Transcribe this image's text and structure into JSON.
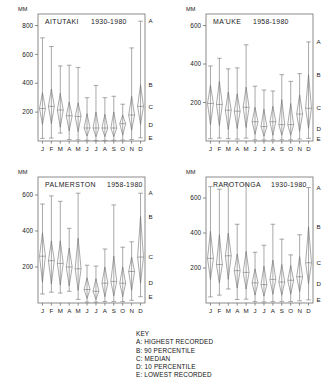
{
  "figure": {
    "axis_unit_label": "MM",
    "months": [
      "J",
      "F",
      "M",
      "A",
      "M",
      "J",
      "J",
      "A",
      "S",
      "O",
      "N",
      "D"
    ],
    "marker_labels": [
      "A",
      "B",
      "C",
      "D",
      "E"
    ]
  },
  "key": {
    "heading": "KEY",
    "items": [
      "A: HIGHEST RECORDED",
      "B: 90 PERCENTILE",
      "C: MEDIAN",
      "D: 10 PERCENTILE",
      "E: LOWEST RECORDED"
    ]
  },
  "chart_data": [
    {
      "type": "box",
      "title": "AITUTAKI",
      "subtitle": "1930-1980",
      "xlabel": "",
      "ylabel": "MM",
      "ylim": [
        0,
        880
      ],
      "yticks": [
        200,
        400,
        600,
        800
      ],
      "grid": false,
      "categories": [
        "J",
        "F",
        "M",
        "A",
        "M",
        "J",
        "J",
        "A",
        "S",
        "O",
        "N",
        "D"
      ],
      "series": [
        {
          "name": "highest",
          "values": [
            715,
            655,
            520,
            525,
            510,
            300,
            385,
            300,
            310,
            255,
            645,
            830
          ]
        },
        {
          "name": "p90",
          "values": [
            335,
            360,
            330,
            270,
            265,
            190,
            200,
            185,
            200,
            180,
            310,
            390
          ]
        },
        {
          "name": "median",
          "values": [
            225,
            240,
            215,
            175,
            170,
            90,
            90,
            90,
            90,
            120,
            180,
            240
          ]
        },
        {
          "name": "p10",
          "values": [
            115,
            120,
            95,
            70,
            65,
            35,
            30,
            30,
            30,
            40,
            75,
            115
          ]
        },
        {
          "name": "lowest",
          "values": [
            18,
            20,
            55,
            10,
            8,
            5,
            4,
            4,
            5,
            6,
            10,
            22
          ]
        }
      ]
    },
    {
      "type": "box",
      "title": "MA'UKE",
      "subtitle": "1958-1980",
      "xlabel": "",
      "ylabel": "MM",
      "ylim": [
        0,
        660
      ],
      "yticks": [
        200,
        400,
        600
      ],
      "grid": false,
      "categories": [
        "J",
        "F",
        "M",
        "A",
        "M",
        "J",
        "J",
        "A",
        "S",
        "O",
        "N",
        "D"
      ],
      "series": [
        {
          "name": "highest",
          "values": [
            390,
            430,
            375,
            380,
            500,
            285,
            265,
            260,
            345,
            310,
            350,
            515
          ]
        },
        {
          "name": "p90",
          "values": [
            290,
            310,
            255,
            245,
            280,
            175,
            165,
            180,
            215,
            195,
            240,
            345
          ]
        },
        {
          "name": "median",
          "values": [
            195,
            190,
            160,
            155,
            175,
            100,
            75,
            100,
            85,
            85,
            140,
            170
          ]
        },
        {
          "name": "p10",
          "values": [
            85,
            80,
            60,
            65,
            70,
            35,
            25,
            30,
            30,
            30,
            50,
            65
          ]
        },
        {
          "name": "lowest",
          "values": [
            12,
            15,
            12,
            10,
            15,
            6,
            5,
            6,
            6,
            6,
            10,
            14
          ]
        }
      ]
    },
    {
      "type": "box",
      "title": "PALMERSTON",
      "subtitle": "1958-1980",
      "xlabel": "",
      "ylabel": "MM",
      "ylim": [
        0,
        700
      ],
      "yticks": [
        200,
        400,
        600
      ],
      "grid": false,
      "categories": [
        "J",
        "F",
        "M",
        "A",
        "M",
        "J",
        "J",
        "A",
        "S",
        "O",
        "N",
        "D"
      ],
      "series": [
        {
          "name": "highest",
          "values": [
            550,
            595,
            565,
            415,
            610,
            210,
            205,
            300,
            545,
            310,
            340,
            610
          ]
        },
        {
          "name": "p90",
          "values": [
            390,
            345,
            345,
            305,
            360,
            140,
            135,
            200,
            260,
            200,
            255,
            480
          ]
        },
        {
          "name": "median",
          "values": [
            260,
            235,
            220,
            200,
            190,
            75,
            65,
            110,
            120,
            110,
            175,
            255
          ]
        },
        {
          "name": "p10",
          "values": [
            115,
            105,
            100,
            95,
            70,
            25,
            20,
            35,
            40,
            35,
            70,
            110
          ]
        },
        {
          "name": "lowest",
          "values": [
            50,
            60,
            55,
            65,
            20,
            5,
            5,
            8,
            8,
            8,
            15,
            35
          ]
        }
      ]
    },
    {
      "type": "box",
      "title": "RAROTONGA",
      "subtitle": "1930-1980",
      "xlabel": "",
      "ylabel": "MM",
      "ylim": [
        0,
        720
      ],
      "yticks": [
        200,
        400,
        600
      ],
      "grid": false,
      "categories": [
        "J",
        "F",
        "M",
        "A",
        "M",
        "J",
        "J",
        "A",
        "S",
        "O",
        "N",
        "D"
      ],
      "series": [
        {
          "name": "highest",
          "values": [
            665,
            650,
            680,
            450,
            675,
            290,
            330,
            450,
            365,
            275,
            390,
            660
          ]
        },
        {
          "name": "p90",
          "values": [
            410,
            390,
            400,
            280,
            295,
            195,
            210,
            245,
            220,
            215,
            265,
            435
          ]
        },
        {
          "name": "median",
          "values": [
            255,
            220,
            270,
            185,
            175,
            115,
            105,
            135,
            120,
            130,
            150,
            230
          ]
        },
        {
          "name": "p10",
          "values": [
            135,
            115,
            135,
            85,
            80,
            45,
            40,
            50,
            45,
            50,
            65,
            110
          ]
        },
        {
          "name": "lowest",
          "values": [
            35,
            45,
            80,
            20,
            22,
            8,
            6,
            8,
            8,
            8,
            12,
            18
          ]
        }
      ]
    }
  ]
}
